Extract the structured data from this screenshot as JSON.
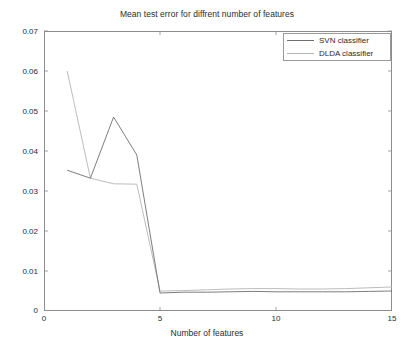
{
  "chart_data": {
    "type": "line",
    "title": "Mean test error for diffrent number of features",
    "xlabel": "Number of features",
    "ylabel": "",
    "xlim": [
      0,
      15
    ],
    "ylim": [
      0,
      0.07
    ],
    "xticks": [
      "0",
      "5",
      "10",
      "15"
    ],
    "xtick_values": [
      0,
      5,
      10,
      15
    ],
    "yticks": [
      "0",
      "0.01",
      "0.02",
      "0.03",
      "0.04",
      "0.05",
      "0.06",
      "0.07"
    ],
    "ytick_values": [
      0,
      0.01,
      0.02,
      0.03,
      0.04,
      0.05,
      0.06,
      0.07
    ],
    "grid": false,
    "legend_position": "top-right",
    "x": [
      1,
      2,
      3,
      4,
      5,
      6,
      7,
      8,
      9,
      10,
      11,
      12,
      13,
      14,
      15
    ],
    "series": [
      {
        "name": "SVN classifier",
        "color": "#6e6e6e",
        "values": [
          0.0352,
          0.0332,
          0.0485,
          0.039,
          0.0045,
          0.0047,
          0.0047,
          0.0048,
          0.0049,
          0.0048,
          0.0048,
          0.0048,
          0.0048,
          0.0049,
          0.005
        ]
      },
      {
        "name": "DLDA classifier",
        "color": "#b4b4b4",
        "values": [
          0.06,
          0.0332,
          0.0318,
          0.0317,
          0.005,
          0.0051,
          0.0053,
          0.0055,
          0.0056,
          0.0056,
          0.0055,
          0.0055,
          0.0056,
          0.0058,
          0.006
        ]
      }
    ]
  },
  "legend": {
    "items": [
      {
        "label": "SVN classifier"
      },
      {
        "label": "DLDA classifier"
      }
    ]
  },
  "axes": {
    "box_color": "#8c8c8c"
  }
}
